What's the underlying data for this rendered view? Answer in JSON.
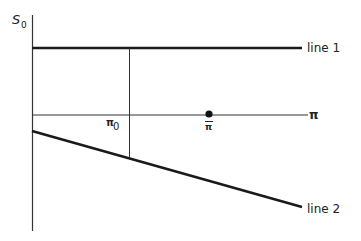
{
  "diagram": {
    "y_axis_label": "S",
    "y_axis_label_sub": "0",
    "x_axis_label": "π",
    "line1_label": "line 1",
    "line2_label": "line 2",
    "pi0_label": "π",
    "pi0_label_sub": "0",
    "pibar_label": "π",
    "colors": {
      "line": "#1a1a1a",
      "thin": "#333333",
      "background": "#ffffff"
    }
  }
}
